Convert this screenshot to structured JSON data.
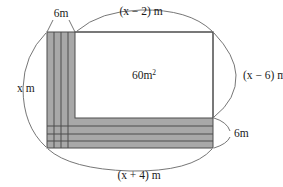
{
  "figure": {
    "type": "geometry-diagram",
    "shape": "rectangle-with-L-shaped-border",
    "labels": {
      "top_band_width": "6m",
      "inner_width": "(x − 2) m",
      "inner_height": "(x − 6) m",
      "inner_area": "60m",
      "inner_area_exponent": "2",
      "outer_height": "x m",
      "outer_width": "(x + 4) m",
      "bottom_band_height": "6m"
    },
    "colors": {
      "shaded_band": "#a8a8a8",
      "inner_fill": "#ffffff",
      "outline": "#4d4d4d",
      "brace": "#666666",
      "text": "#1a1a1a",
      "background": "#ffffff"
    },
    "geometry": {
      "outer_left": 47,
      "outer_top": 32,
      "outer_right": 213,
      "outer_bottom": 148,
      "inner_left": 75,
      "inner_top": 32,
      "inner_right": 213,
      "inner_bottom": 118,
      "left_band_gridlines_x": [
        54,
        61,
        68
      ],
      "bottom_band_gridlines_y": [
        126,
        134,
        141
      ]
    }
  }
}
